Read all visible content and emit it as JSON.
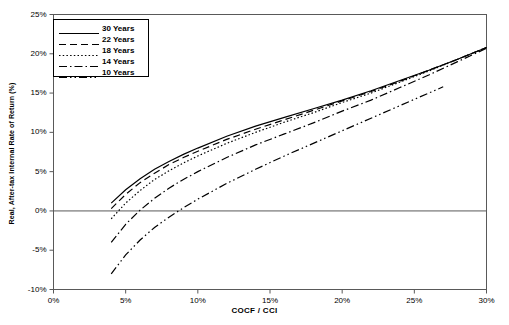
{
  "chart_data": {
    "type": "line",
    "title": "",
    "xlabel": "COCF / CCI",
    "ylabel": "Real, After-tax Internal Rate of Return (%)",
    "xlim": [
      0,
      30
    ],
    "ylim": [
      -10,
      25
    ],
    "xticks": [
      "0%",
      "5%",
      "10%",
      "15%",
      "20%",
      "25%",
      "30%"
    ],
    "xtick_values": [
      0,
      5,
      10,
      15,
      20,
      25,
      30
    ],
    "yticks": [
      "-10%",
      "-5%",
      "0%",
      "5%",
      "10%",
      "15%",
      "20%",
      "25%"
    ],
    "ytick_values": [
      -10,
      -5,
      0,
      5,
      10,
      15,
      20,
      25
    ],
    "grid": false,
    "zero_line": true,
    "legend_position": "upper-left",
    "legend_title": "",
    "series": [
      {
        "name": "30 Years",
        "style": "solid",
        "dash": "none",
        "color": "#000000",
        "x": [
          4.0,
          5.0,
          6.0,
          7.0,
          8.0,
          9.0,
          10.0,
          12.0,
          14.0,
          16.0,
          18.0,
          20.0,
          22.0,
          24.0,
          26.0,
          28.0,
          30.0
        ],
        "y": [
          1.0,
          2.7,
          4.1,
          5.3,
          6.3,
          7.2,
          8.0,
          9.5,
          10.8,
          11.9,
          13.0,
          14.1,
          15.3,
          16.6,
          17.9,
          19.3,
          20.8
        ]
      },
      {
        "name": "22 Years",
        "style": "dashed",
        "dash": "7,4",
        "color": "#000000",
        "x": [
          4.0,
          5.0,
          6.0,
          7.0,
          8.0,
          9.0,
          10.0,
          12.0,
          14.0,
          16.0,
          18.0,
          20.0,
          22.0,
          24.0,
          26.0,
          28.0,
          30.0
        ],
        "y": [
          0.3,
          2.1,
          3.6,
          4.8,
          5.9,
          6.8,
          7.6,
          9.1,
          10.4,
          11.6,
          12.8,
          14.0,
          15.2,
          16.5,
          17.9,
          19.3,
          20.8
        ]
      },
      {
        "name": "18 Years",
        "style": "dotted",
        "dash": "1.5,2.2",
        "color": "#000000",
        "x": [
          4.0,
          5.0,
          6.0,
          7.0,
          8.0,
          9.0,
          10.0,
          12.0,
          14.0,
          16.0,
          18.0,
          20.0,
          22.0,
          24.0,
          26.0,
          28.0,
          30.0
        ],
        "y": [
          -1.0,
          1.0,
          2.6,
          4.0,
          5.1,
          6.1,
          7.0,
          8.6,
          10.0,
          11.3,
          12.5,
          13.8,
          15.0,
          16.4,
          17.8,
          19.3,
          20.8
        ]
      },
      {
        "name": "14 Years",
        "style": "dash-dot",
        "dash": "8,3,1.5,3",
        "color": "#000000",
        "x": [
          4.0,
          5.0,
          6.0,
          7.0,
          8.0,
          9.0,
          10.0,
          12.0,
          14.0,
          16.0,
          18.0,
          20.0,
          22.0,
          24.0,
          26.0,
          28.0,
          30.0
        ],
        "y": [
          -4.0,
          -1.7,
          0.1,
          1.6,
          2.9,
          4.0,
          5.0,
          6.8,
          8.4,
          9.8,
          11.2,
          12.7,
          14.1,
          15.7,
          17.3,
          19.0,
          20.7
        ]
      },
      {
        "name": "10 Years",
        "style": "dash-dot-dot",
        "dash": "8,3,1.5,3,1.5,3",
        "color": "#000000",
        "x": [
          4.0,
          5.0,
          6.0,
          7.0,
          8.0,
          9.0,
          10.0,
          12.0,
          14.0,
          16.0,
          18.0,
          20.0,
          22.0,
          24.0,
          26.0,
          27.0
        ],
        "y": [
          -8.0,
          -5.6,
          -3.7,
          -2.1,
          -0.8,
          0.4,
          1.5,
          3.5,
          5.3,
          7.0,
          8.6,
          10.2,
          11.8,
          13.4,
          15.0,
          15.8
        ]
      }
    ]
  },
  "axis": {
    "x_title": "COCF / CCI",
    "y_title": "Real, After-tax Internal Rate of Return (%)"
  }
}
